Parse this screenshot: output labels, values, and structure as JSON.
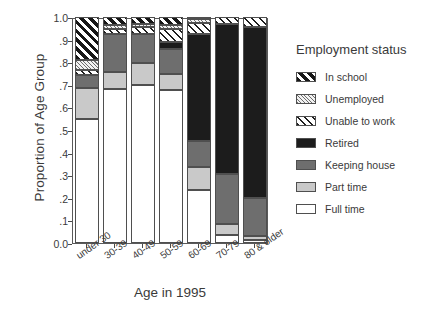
{
  "chart_data": {
    "type": "bar",
    "subtype": "stacked-bar-100-percent",
    "title": "",
    "xlabel": "Age in 1995",
    "ylabel": "Proportion of Age Group",
    "categories": [
      "under 30",
      "30-39",
      "40-49",
      "50-59",
      "60-69",
      "70-79",
      "80 & older"
    ],
    "ylim": [
      0.0,
      1.0
    ],
    "yticks": [
      "0.0",
      ".1",
      ".2",
      ".3",
      ".4",
      ".5",
      ".6",
      ".7",
      ".8",
      ".9",
      "1.0"
    ],
    "ytick_values": [
      0.0,
      0.1,
      0.2,
      0.3,
      0.4,
      0.5,
      0.6,
      0.7,
      0.8,
      0.9,
      1.0
    ],
    "grid": false,
    "legend_position": "right",
    "legend_title": "Employment status",
    "series": [
      {
        "name": "Full time",
        "pattern": "solid-white",
        "values": [
          0.55,
          0.68,
          0.7,
          0.675,
          0.235,
          0.035,
          0.015
        ]
      },
      {
        "name": "Part time",
        "pattern": "solid-light-gray",
        "values": [
          0.135,
          0.075,
          0.095,
          0.075,
          0.1,
          0.05,
          0.015
        ]
      },
      {
        "name": "Keeping house",
        "pattern": "solid-dark-gray",
        "values": [
          0.06,
          0.17,
          0.13,
          0.11,
          0.115,
          0.22,
          0.17
        ]
      },
      {
        "name": "Retired",
        "pattern": "solid-black",
        "values": [
          0.0,
          0.0,
          0.0,
          0.03,
          0.475,
          0.665,
          0.755
        ]
      },
      {
        "name": "Unable to work",
        "pattern": "diagonal-hatch",
        "values": [
          0.02,
          0.02,
          0.03,
          0.055,
          0.05,
          0.03,
          0.045
        ]
      },
      {
        "name": "Unemployed",
        "pattern": "fine-stipple",
        "values": [
          0.045,
          0.02,
          0.015,
          0.02,
          0.015,
          0.0,
          0.0
        ]
      },
      {
        "name": "In school",
        "pattern": "bold-diagonal",
        "values": [
          0.19,
          0.035,
          0.03,
          0.035,
          0.01,
          0.0,
          0.0
        ]
      }
    ],
    "cumulative_tops": {
      "under 30": {
        "Full time": 0.55,
        "Part time": 0.685,
        "Keeping house": 0.745,
        "Retired": 0.745,
        "Unable to work": 0.765,
        "Unemployed": 0.81,
        "In school": 1.0
      },
      "30-39": {
        "Full time": 0.68,
        "Part time": 0.755,
        "Keeping house": 0.925,
        "Retired": 0.925,
        "Unable to work": 0.945,
        "Unemployed": 0.965,
        "In school": 1.0
      },
      "40-49": {
        "Full time": 0.7,
        "Part time": 0.795,
        "Keeping house": 0.925,
        "Retired": 0.925,
        "Unable to work": 0.955,
        "Unemployed": 0.97,
        "In school": 1.0
      },
      "50-59": {
        "Full time": 0.675,
        "Part time": 0.75,
        "Keeping house": 0.86,
        "Retired": 0.89,
        "Unable to work": 0.945,
        "Unemployed": 0.965,
        "In school": 1.0
      },
      "60-69": {
        "Full time": 0.235,
        "Part time": 0.335,
        "Keeping house": 0.45,
        "Retired": 0.925,
        "Unable to work": 0.975,
        "Unemployed": 0.99,
        "In school": 1.0
      },
      "70-79": {
        "Full time": 0.035,
        "Part time": 0.085,
        "Keeping house": 0.305,
        "Retired": 0.97,
        "Unable to work": 1.0,
        "Unemployed": 1.0,
        "In school": 1.0
      },
      "80 & older": {
        "Full time": 0.015,
        "Part time": 0.03,
        "Keeping house": 0.2,
        "Retired": 0.955,
        "Unable to work": 1.0,
        "Unemployed": 1.0,
        "In school": 1.0
      }
    }
  },
  "legend": {
    "title": "Employment status",
    "items": [
      {
        "label": "In school",
        "pattern": "bold-diagonal"
      },
      {
        "label": "Unemployed",
        "pattern": "fine-stipple"
      },
      {
        "label": "Unable to work",
        "pattern": "diagonal-hatch"
      },
      {
        "label": "Retired",
        "pattern": "solid-black"
      },
      {
        "label": "Keeping house",
        "pattern": "solid-dark-gray"
      },
      {
        "label": "Part time",
        "pattern": "solid-light-gray"
      },
      {
        "label": "Full time",
        "pattern": "solid-white"
      }
    ]
  },
  "axes": {
    "x_title": "Age in 1995",
    "y_title": "Proportion of Age Group"
  },
  "colors": {
    "full_time": "#ffffff",
    "part_time": "#c9c9c9",
    "keeping_house": "#6e6e6e",
    "retired": "#1c1c1c",
    "axis": "#4a4a4a",
    "text": "#3a3a3a"
  }
}
